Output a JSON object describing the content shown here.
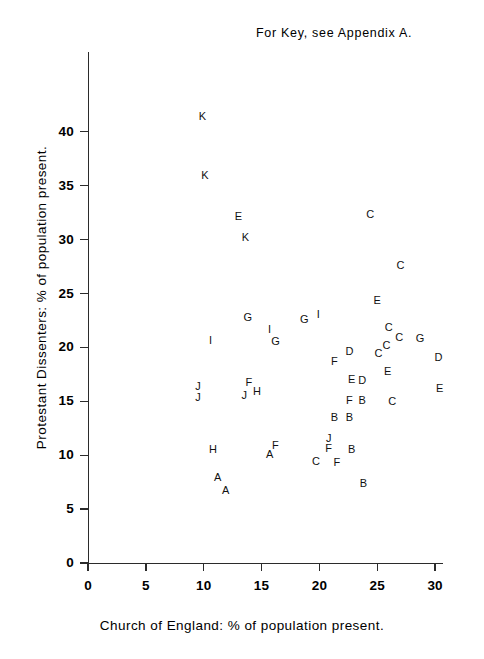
{
  "chart_data": {
    "type": "scatter",
    "title": "",
    "annotation": "For Key, see Appendix A.",
    "xlabel": "Church of England: % of population present.",
    "ylabel": "Protestant Dissenters: % of population present.",
    "xlim": [
      0,
      31.5
    ],
    "ylim": [
      0,
      43
    ],
    "xticks": [
      0,
      5,
      10,
      15,
      20,
      25,
      30
    ],
    "yticks": [
      0,
      5,
      10,
      15,
      20,
      25,
      30,
      35,
      40
    ],
    "xtick_labels": [
      "0",
      "5",
      "10",
      "15",
      "20",
      "25",
      "30"
    ],
    "ytick_labels": [
      "0",
      "5",
      "10",
      "15",
      "20",
      "25",
      "30",
      "35",
      "40"
    ],
    "grid": false,
    "legend": "none",
    "marker_style": "letter-label",
    "points": [
      {
        "label": "K",
        "x": 9.9,
        "y": 41.5
      },
      {
        "label": "K",
        "x": 10.1,
        "y": 36.0
      },
      {
        "label": "E",
        "x": 13.0,
        "y": 32.2
      },
      {
        "label": "C",
        "x": 24.4,
        "y": 32.4
      },
      {
        "label": "K",
        "x": 13.6,
        "y": 30.2
      },
      {
        "label": "C",
        "x": 27.0,
        "y": 27.6
      },
      {
        "label": "E",
        "x": 25.0,
        "y": 24.4
      },
      {
        "label": "I",
        "x": 19.9,
        "y": 23.1
      },
      {
        "label": "G",
        "x": 13.8,
        "y": 22.8
      },
      {
        "label": "G",
        "x": 18.7,
        "y": 22.6
      },
      {
        "label": "I",
        "x": 15.7,
        "y": 21.7
      },
      {
        "label": "G",
        "x": 16.2,
        "y": 20.6
      },
      {
        "label": "C",
        "x": 26.0,
        "y": 21.9
      },
      {
        "label": "C",
        "x": 26.9,
        "y": 21.0
      },
      {
        "label": "G",
        "x": 28.7,
        "y": 20.9
      },
      {
        "label": "C",
        "x": 25.8,
        "y": 20.2
      },
      {
        "label": "I",
        "x": 10.6,
        "y": 20.7
      },
      {
        "label": "D",
        "x": 22.6,
        "y": 19.7
      },
      {
        "label": "C",
        "x": 25.1,
        "y": 19.5
      },
      {
        "label": "D",
        "x": 30.3,
        "y": 19.1
      },
      {
        "label": "F",
        "x": 21.3,
        "y": 18.7
      },
      {
        "label": "E",
        "x": 25.9,
        "y": 17.8
      },
      {
        "label": "E",
        "x": 22.8,
        "y": 17.1
      },
      {
        "label": "D",
        "x": 23.7,
        "y": 17.0
      },
      {
        "label": "F",
        "x": 13.9,
        "y": 16.8
      },
      {
        "label": "J",
        "x": 9.5,
        "y": 16.4
      },
      {
        "label": "H",
        "x": 14.6,
        "y": 16.0
      },
      {
        "label": "J",
        "x": 13.5,
        "y": 15.6
      },
      {
        "label": "J",
        "x": 9.5,
        "y": 15.4
      },
      {
        "label": "E",
        "x": 30.4,
        "y": 16.2
      },
      {
        "label": "F",
        "x": 22.6,
        "y": 15.1
      },
      {
        "label": "B",
        "x": 23.7,
        "y": 15.1
      },
      {
        "label": "C",
        "x": 26.3,
        "y": 15.0
      },
      {
        "label": "B",
        "x": 21.3,
        "y": 13.5
      },
      {
        "label": "B",
        "x": 22.6,
        "y": 13.5
      },
      {
        "label": "J",
        "x": 20.8,
        "y": 11.6
      },
      {
        "label": "F",
        "x": 16.2,
        "y": 10.9
      },
      {
        "label": "H",
        "x": 10.8,
        "y": 10.6
      },
      {
        "label": "B",
        "x": 22.8,
        "y": 10.6
      },
      {
        "label": "F",
        "x": 20.8,
        "y": 10.7
      },
      {
        "label": "A",
        "x": 15.7,
        "y": 10.1
      },
      {
        "label": "C",
        "x": 19.7,
        "y": 9.5
      },
      {
        "label": "F",
        "x": 21.5,
        "y": 9.4
      },
      {
        "label": "A",
        "x": 11.2,
        "y": 8.0
      },
      {
        "label": "B",
        "x": 23.8,
        "y": 7.4
      },
      {
        "label": "A",
        "x": 11.9,
        "y": 6.8
      }
    ]
  },
  "axes": {
    "x_title": "Church of England: % of population present.",
    "y_title": "Protestant Dissenters: % of population present."
  },
  "note": {
    "text": "For Key, see Appendix A."
  }
}
